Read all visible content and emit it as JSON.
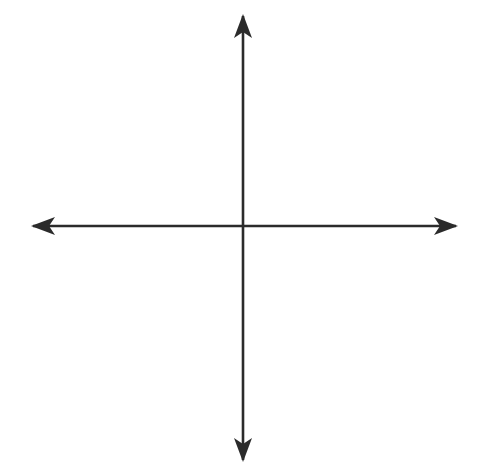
{
  "figure": {
    "kind": "coordinate-plane",
    "background_color": "#ffffff"
  },
  "chart_data": {
    "type": "scatter",
    "title": "",
    "subtitle": "",
    "xlabel": "x",
    "ylabel": "y",
    "xlim": [
      -9,
      9
    ],
    "ylim": [
      -9,
      9
    ],
    "grid": true,
    "grid_step": 1,
    "legend": "none",
    "origin_label": "O",
    "series": [],
    "x": [],
    "y": [],
    "annotations": [],
    "x_tick_labels": [
      "–6",
      "–4",
      "–2",
      "2",
      "4",
      "6"
    ],
    "x_tick_values": [
      -6,
      -4,
      -2,
      2,
      4,
      6
    ],
    "y_tick_labels": [
      "6",
      "4",
      "2",
      "–2",
      "–4",
      "–6"
    ],
    "y_tick_values": [
      6,
      4,
      2,
      -2,
      -4,
      -6
    ]
  },
  "axes": {
    "x_axis_name": "x",
    "y_axis_name": "y",
    "origin_label": "O",
    "axis_color": "#2b2b2b",
    "grid_color": "#6e6e6e",
    "grid_minor_color": "#8c8c8c"
  },
  "x_ticks": [
    {
      "label": "–6",
      "value": -6
    },
    {
      "label": "–4",
      "value": -4
    },
    {
      "label": "–2",
      "value": -2
    },
    {
      "label": "2",
      "value": 2
    },
    {
      "label": "4",
      "value": 4
    },
    {
      "label": "6",
      "value": 6
    }
  ],
  "y_ticks": [
    {
      "label": "6",
      "value": 6
    },
    {
      "label": "4",
      "value": 4
    },
    {
      "label": "2",
      "value": 2
    },
    {
      "label": "–2",
      "value": -2
    },
    {
      "label": "–4",
      "value": -4
    },
    {
      "label": "–6",
      "value": -6
    }
  ],
  "grid_geometry": {
    "left": 63,
    "top": 46,
    "cell": 20,
    "cols": 18,
    "rows": 18,
    "origin_x": 243,
    "origin_y": 226
  },
  "arrows": {
    "left_tip_x": 33,
    "right_tip_x": 456,
    "top_tip_y": 16,
    "bottom_tip_y": 460
  }
}
